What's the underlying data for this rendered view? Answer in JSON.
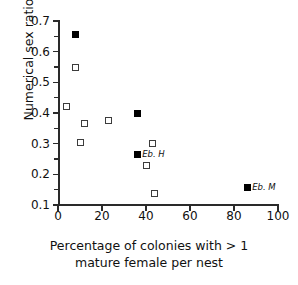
{
  "chart_data": {
    "type": "scatter",
    "title": "",
    "xlabel": "Percentage of colonies with > 1 mature female per nest",
    "xlabel_line1": "Percentage of colonies with > 1",
    "xlabel_line2": "mature female per nest",
    "ylabel": "Numerical sex ratio",
    "xlim": [
      0,
      100
    ],
    "ylim": [
      0.1,
      0.7
    ],
    "xticks": [
      0,
      20,
      40,
      60,
      80,
      100
    ],
    "xtick_labels": [
      "0",
      "20",
      "40",
      "60",
      "80",
      "100"
    ],
    "yticks": [
      0.1,
      0.2,
      0.3,
      0.4,
      0.5,
      0.6,
      0.7
    ],
    "ytick_labels": [
      "0.1",
      "0.2",
      "0.3",
      "0.4",
      "0.5",
      "0.6",
      "0.7"
    ],
    "yminor_ticks": [
      0.15,
      0.25,
      0.35,
      0.45,
      0.55,
      0.65
    ],
    "grid": false,
    "legend": "none",
    "series": [
      {
        "name": "filled",
        "marker": "filled-square",
        "color": "#000000",
        "points": [
          {
            "x": 8,
            "y": 0.655,
            "label": ""
          },
          {
            "x": 36,
            "y": 0.399,
            "label": ""
          },
          {
            "x": 36,
            "y": 0.266,
            "label": "Eb. H"
          },
          {
            "x": 86,
            "y": 0.158,
            "label": "Eb. M"
          }
        ]
      },
      {
        "name": "open",
        "marker": "open-square",
        "color": "#3c3c3c",
        "points": [
          {
            "x": 8,
            "y": 0.547,
            "label": ""
          },
          {
            "x": 4,
            "y": 0.42,
            "label": ""
          },
          {
            "x": 12,
            "y": 0.367,
            "label": ""
          },
          {
            "x": 23,
            "y": 0.374,
            "label": ""
          },
          {
            "x": 10,
            "y": 0.304,
            "label": ""
          },
          {
            "x": 43,
            "y": 0.3,
            "label": ""
          },
          {
            "x": 40,
            "y": 0.229,
            "label": ""
          },
          {
            "x": 44,
            "y": 0.139,
            "label": ""
          }
        ]
      }
    ]
  }
}
